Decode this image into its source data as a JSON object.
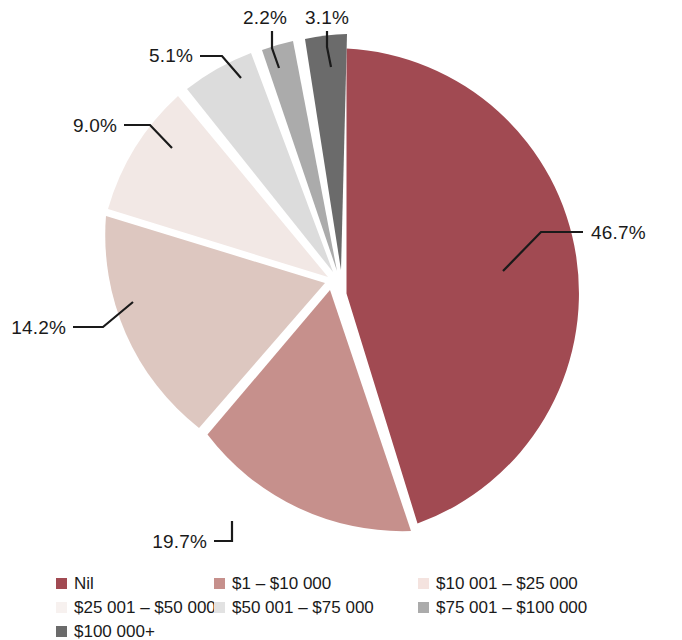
{
  "chart_data": {
    "type": "pie",
    "title": "",
    "subtitle": "",
    "xlabel": "",
    "ylabel": "",
    "legend_position": "bottom",
    "grid": false,
    "exploded": true,
    "start_angle_deg": 0,
    "direction": "clockwise",
    "categories": [
      "Nil",
      "$1 – $10 000",
      "$10 001 – $25 000",
      "$25 001 – $50 000",
      "$50 001 – $75 000",
      "$75 001 – $100 000",
      "$100 000+"
    ],
    "values": [
      46.7,
      19.7,
      14.2,
      9.0,
      5.1,
      2.2,
      3.1
    ],
    "value_labels": [
      "46.7%",
      "19.7%",
      "14.2%",
      "9.0%",
      "5.1%",
      "2.2%",
      "3.1%"
    ],
    "colors": [
      "#A14A52",
      "#C6908C",
      "#DDC7C0",
      "#F2E8E5",
      "#DCDCDC",
      "#ABABAB",
      "#6B6B6B"
    ],
    "units": "percent",
    "total": 100.0
  },
  "pie": {
    "slices": [
      {
        "name": "Nil",
        "label": "46.7%",
        "value": 46.7,
        "color": "#A14A52",
        "path": "M 346.5 48.5 A 245 245 0 0 1 417.5 523.5 L 346.5 293.5 Z",
        "leader": "M 583 232 L 541 232 L 503 271",
        "label_x": 591,
        "label_y": 239,
        "label_anchor": "start"
      },
      {
        "name": "$1 – $10 000",
        "label": "19.7%",
        "value": 19.7,
        "color": "#C6908C",
        "path": "M 411 531 A 245 245 0 0 1 207.5 434.5 L 330 290 Z",
        "leader": "M 214 541 L 232 541 L 232 521",
        "label_x": 207,
        "label_y": 548,
        "label_anchor": "end"
      },
      {
        "name": "$10 001 – $25 000",
        "label": "14.2%",
        "value": 14.2,
        "color": "#DDC7C0",
        "path": "M 199 428 A 245 245 0 0 1 106 216 L 325 283 Z",
        "leader": "M 73 327 L 103 327 L 133 302",
        "label_x": 66,
        "label_y": 334,
        "label_anchor": "end"
      },
      {
        "name": "$25 001 – $50 000",
        "label": "9.0%",
        "value": 9.0,
        "color": "#F2E8E5",
        "path": "M 108 209 A 245 245 0 0 1 178 96 L 328 277 Z",
        "leader": "M 124 125 L 150 125 L 172 148",
        "label_x": 117,
        "label_y": 132,
        "label_anchor": "end"
      },
      {
        "name": "$50 001 – $75 000",
        "label": "5.1%",
        "value": 5.1,
        "color": "#DCDCDC",
        "path": "M 187 89 A 245 245 0 0 1 251 53 L 333 272 Z",
        "leader": "M 200 56 L 222 56 L 241 78",
        "label_x": 193,
        "label_y": 62,
        "label_anchor": "end"
      },
      {
        "name": "$75 001 – $100 000",
        "label": "2.2%",
        "value": 2.2,
        "color": "#ABABAB",
        "path": "M 262 50 A 245 245 0 0 1 293 41 L 337 271 Z",
        "leader": "M 272 31 L 272 48 L 279 68",
        "label_x": 265,
        "label_y": 24,
        "label_anchor": "middle"
      },
      {
        "name": "$100 000+",
        "label": "3.1%",
        "value": 3.1,
        "color": "#6B6B6B",
        "path": "M 305 39 A 245 245 0 0 1 347 34 L 341 270 Z",
        "leader": "M 327 31 L 327 47 L 331 67",
        "label_x": 327,
        "label_y": 24,
        "label_anchor": "middle"
      }
    ]
  },
  "legend": {
    "rows": [
      [
        {
          "label": "Nil",
          "color": "#A14A52"
        },
        {
          "label": "$1 – $10 000",
          "color": "#C6908C"
        },
        {
          "label": "$10 001 – $25 000",
          "color": "#F4E3DF"
        }
      ],
      [
        {
          "label": "$25 001 – $50 000",
          "color": "#F7F1EF"
        },
        {
          "label": "$50 001 – $75 000",
          "color": "#E2E2E2"
        },
        {
          "label": "$75 001 – $100 000",
          "color": "#ABABAB"
        }
      ],
      [
        {
          "label": "$100 000+",
          "color": "#6B6B6B"
        }
      ]
    ]
  }
}
